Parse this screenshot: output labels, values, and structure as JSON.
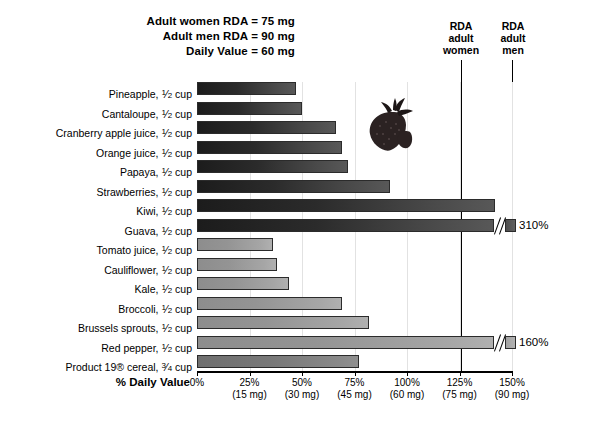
{
  "header": {
    "note_lines": [
      "Adult women RDA = 75 mg",
      "Adult men RDA = 90 mg",
      "Daily Value = 60 mg"
    ],
    "rda_women_label": "RDA\nadult\nwomen",
    "rda_women_l1": "RDA",
    "rda_women_l2": "adult",
    "rda_women_l3": "women",
    "rda_men_l1": "RDA",
    "rda_men_l2": "adult",
    "rda_men_l3": "men"
  },
  "axis": {
    "title": "% Daily Value",
    "ticks": [
      {
        "pct": "0%",
        "mg": ""
      },
      {
        "pct": "25%",
        "mg": "(15 mg)"
      },
      {
        "pct": "50%",
        "mg": "(30 mg)"
      },
      {
        "pct": "75%",
        "mg": "(45 mg)"
      },
      {
        "pct": "100%",
        "mg": "(60 mg)"
      },
      {
        "pct": "125%",
        "mg": "(75 mg)"
      },
      {
        "pct": "150%",
        "mg": "(90 mg)"
      }
    ]
  },
  "illustration": {
    "name": "strawberry-illustration",
    "color": "#2e2424"
  },
  "colors": {
    "fruit_bar": "#333333",
    "vegetable_bar": "#9a9a9a",
    "cereal_bar": "#7d7d7d",
    "axis": "#000000",
    "gridline": "#e2e2e2"
  },
  "chart_data": {
    "type": "bar",
    "orientation": "horizontal",
    "xlabel": "% Daily Value",
    "ylabel": "",
    "xlim": [
      0,
      150
    ],
    "grid": true,
    "legend": "none",
    "annotations": [
      "Adult women RDA = 75 mg",
      "Adult men RDA = 90 mg",
      "Daily Value = 60 mg"
    ],
    "reference_lines": [
      {
        "label": "RDA adult women",
        "value": 125
      },
      {
        "label": "RDA adult men",
        "value": 150
      }
    ],
    "axis_tick_values": [
      0,
      25,
      50,
      75,
      100,
      125,
      150
    ],
    "axis_tick_mg": [
      "",
      "15 mg",
      "30 mg",
      "45 mg",
      "60 mg",
      "75 mg",
      "90 mg"
    ],
    "categories": [
      "Pineapple, 1/2 cup",
      "Cantaloupe, 1/2 cup",
      "Cranberry apple juice, 1/2 cup",
      "Orange juice, 1/2 cup",
      "Papaya, 1/2 cup",
      "Strawberries, 1/2 cup",
      "Kiwi, 1/2 cup",
      "Guava, 1/2 cup",
      "Tomato juice, 1/2 cup",
      "Cauliflower, 1/2 cup",
      "Kale, 1/2 cup",
      "Broccoli, 1/2 cup",
      "Brussels sprouts, 1/2 cup",
      "Red pepper, 1/2 cup",
      "Product 19® cereal, 3/4 cup"
    ],
    "values": [
      47,
      50,
      66,
      69,
      72,
      92,
      142,
      310,
      36,
      38,
      44,
      69,
      82,
      160,
      77
    ],
    "value_labels": [
      "",
      "",
      "",
      "",
      "",
      "",
      "",
      "310%",
      "",
      "",
      "",
      "",
      "",
      "160%",
      ""
    ]
  },
  "rows": [
    {
      "name": "Pineapple",
      "amount": "1/2",
      "unit": "cup",
      "value": 47,
      "group": "fruit",
      "truncated": false,
      "label": ""
    },
    {
      "name": "Cantaloupe",
      "amount": "1/2",
      "unit": "cup",
      "value": 50,
      "group": "fruit",
      "truncated": false,
      "label": ""
    },
    {
      "name": "Cranberry apple juice",
      "amount": "1/2",
      "unit": "cup",
      "value": 66,
      "group": "fruit",
      "truncated": false,
      "label": ""
    },
    {
      "name": "Orange juice",
      "amount": "1/2",
      "unit": "cup",
      "value": 69,
      "group": "fruit",
      "truncated": false,
      "label": ""
    },
    {
      "name": "Papaya",
      "amount": "1/2",
      "unit": "cup",
      "value": 72,
      "group": "fruit",
      "truncated": false,
      "label": ""
    },
    {
      "name": "Strawberries",
      "amount": "1/2",
      "unit": "cup",
      "value": 92,
      "group": "fruit",
      "truncated": false,
      "label": ""
    },
    {
      "name": "Kiwi",
      "amount": "1/2",
      "unit": "cup",
      "value": 142,
      "group": "fruit",
      "truncated": false,
      "label": ""
    },
    {
      "name": "Guava",
      "amount": "1/2",
      "unit": "cup",
      "value": 310,
      "group": "fruit",
      "truncated": true,
      "label": "310%"
    },
    {
      "name": "Tomato juice",
      "amount": "1/2",
      "unit": "cup",
      "value": 36,
      "group": "veg",
      "truncated": false,
      "label": ""
    },
    {
      "name": "Cauliflower",
      "amount": "1/2",
      "unit": "cup",
      "value": 38,
      "group": "veg",
      "truncated": false,
      "label": ""
    },
    {
      "name": "Kale",
      "amount": "1/2",
      "unit": "cup",
      "value": 44,
      "group": "veg",
      "truncated": false,
      "label": ""
    },
    {
      "name": "Broccoli",
      "amount": "1/2",
      "unit": "cup",
      "value": 69,
      "group": "veg",
      "truncated": false,
      "label": ""
    },
    {
      "name": "Brussels sprouts",
      "amount": "1/2",
      "unit": "cup",
      "value": 82,
      "group": "veg",
      "truncated": false,
      "label": ""
    },
    {
      "name": "Red pepper",
      "amount": "1/2",
      "unit": "cup",
      "value": 160,
      "group": "veg",
      "truncated": true,
      "label": "160%"
    },
    {
      "name": "Product 19® cereal",
      "amount": "3/4",
      "unit": "cup",
      "value": 77,
      "group": "cereal",
      "truncated": false,
      "label": ""
    }
  ]
}
